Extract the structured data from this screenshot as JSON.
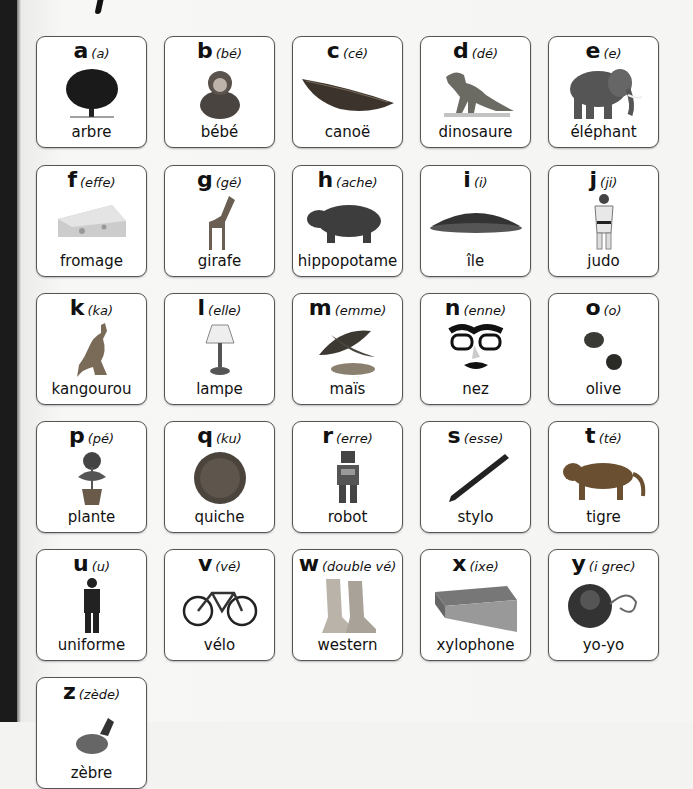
{
  "alphabet": [
    {
      "letter": "a",
      "pron": "(a)",
      "word": "arbre",
      "icon": "tree-icon"
    },
    {
      "letter": "b",
      "pron": "(bé)",
      "word": "bébé",
      "icon": "baby-icon"
    },
    {
      "letter": "c",
      "pron": "(cé)",
      "word": "canoë",
      "icon": "canoe-icon"
    },
    {
      "letter": "d",
      "pron": "(dé)",
      "word": "dinosaure",
      "icon": "dinosaur-icon"
    },
    {
      "letter": "e",
      "pron": "(e)",
      "word": "éléphant",
      "icon": "elephant-icon"
    },
    {
      "letter": "f",
      "pron": "(effe)",
      "word": "fromage",
      "icon": "cheese-icon"
    },
    {
      "letter": "g",
      "pron": "(gé)",
      "word": "girafe",
      "icon": "giraffe-icon"
    },
    {
      "letter": "h",
      "pron": "(ache)",
      "word": "hippopotame",
      "icon": "hippo-icon"
    },
    {
      "letter": "i",
      "pron": "(i)",
      "word": "île",
      "icon": "island-icon"
    },
    {
      "letter": "j",
      "pron": "(ji)",
      "word": "judo",
      "icon": "judo-icon"
    },
    {
      "letter": "k",
      "pron": "(ka)",
      "word": "kangourou",
      "icon": "kangaroo-icon"
    },
    {
      "letter": "l",
      "pron": "(elle)",
      "word": "lampe",
      "icon": "lamp-icon"
    },
    {
      "letter": "m",
      "pron": "(emme)",
      "word": "maïs",
      "icon": "corn-icon"
    },
    {
      "letter": "n",
      "pron": "(enne)",
      "word": "nez",
      "icon": "nose-glasses-icon"
    },
    {
      "letter": "o",
      "pron": "(o)",
      "word": "olive",
      "icon": "olive-icon"
    },
    {
      "letter": "p",
      "pron": "(pé)",
      "word": "plante",
      "icon": "plant-icon"
    },
    {
      "letter": "q",
      "pron": "(ku)",
      "word": "quiche",
      "icon": "quiche-icon"
    },
    {
      "letter": "r",
      "pron": "(erre)",
      "word": "robot",
      "icon": "robot-icon"
    },
    {
      "letter": "s",
      "pron": "(esse)",
      "word": "stylo",
      "icon": "pen-icon"
    },
    {
      "letter": "t",
      "pron": "(té)",
      "word": "tigre",
      "icon": "tiger-icon"
    },
    {
      "letter": "u",
      "pron": "(u)",
      "word": "uniforme",
      "icon": "uniform-icon"
    },
    {
      "letter": "v",
      "pron": "(vé)",
      "word": "vélo",
      "icon": "bicycle-icon"
    },
    {
      "letter": "w",
      "pron": "(double vé)",
      "word": "western",
      "icon": "boots-icon"
    },
    {
      "letter": "x",
      "pron": "(ixe)",
      "word": "xylophone",
      "icon": "xylophone-icon"
    },
    {
      "letter": "y",
      "pron": "(i grec)",
      "word": "yo-yo",
      "icon": "yoyo-icon"
    },
    {
      "letter": "z",
      "pron": "(zède)",
      "word": "zèbre",
      "icon": "zebra-icon"
    }
  ],
  "colors": {
    "card_border": "#555555",
    "card_bg": "#ffffff",
    "page_bg": "#f3f3f1",
    "spine": "#1b1b1b",
    "text": "#111111"
  }
}
